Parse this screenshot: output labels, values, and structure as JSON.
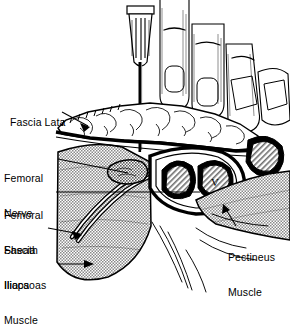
{
  "figure": {
    "style": "black-and-white line art",
    "background_color": "#ffffff",
    "ink_color": "#000000"
  },
  "labels": [
    {
      "id": "fascia-lata",
      "text": "Fascia Lata",
      "lines": [
        "Fascia Lata"
      ],
      "x": 4,
      "y": 105,
      "align": "left"
    },
    {
      "id": "femoral-nerve",
      "text": "Femoral Nerve",
      "lines": [
        "Femoral",
        "Nerve"
      ],
      "x": 4,
      "y": 150,
      "align": "left"
    },
    {
      "id": "femoral-sheath",
      "text": "Femoral Sheath",
      "lines": [
        "Femoral",
        "Sheath"
      ],
      "x": 4,
      "y": 187,
      "align": "left"
    },
    {
      "id": "fascia-iliaca",
      "text": "Fascia Iliaca",
      "lines": [
        "Fascia",
        "Iliaca"
      ],
      "x": 4,
      "y": 222,
      "align": "left"
    },
    {
      "id": "iliopsoas-muscle",
      "text": "Iliopsoas Muscle",
      "lines": [
        "Iliopsoas",
        "Muscle"
      ],
      "x": 4,
      "y": 257,
      "align": "left"
    },
    {
      "id": "pectineus-muscle",
      "text": "Pectineus Muscle",
      "lines": [
        "Pectineus",
        "Muscle"
      ],
      "x": 228,
      "y": 229,
      "align": "left"
    }
  ],
  "structures": [
    {
      "id": "needle",
      "name": "needle with hub"
    },
    {
      "id": "fingers",
      "name": "palpating fingers"
    },
    {
      "id": "skin",
      "name": "skin surface"
    },
    {
      "id": "subcutaneous-fat",
      "name": "subcutaneous fat"
    },
    {
      "id": "fascia-lata-layer",
      "name": "fascia lata"
    },
    {
      "id": "femoral-nerve-body",
      "name": "femoral nerve"
    },
    {
      "id": "femoral-artery",
      "name": "femoral artery"
    },
    {
      "id": "femoral-vein",
      "name": "femoral vein",
      "marking": "V"
    },
    {
      "id": "iliopsoas-body",
      "name": "iliopsoas muscle"
    },
    {
      "id": "pectineus-body",
      "name": "pectineus muscle"
    }
  ],
  "annotations": {
    "vein_marker": "V"
  }
}
